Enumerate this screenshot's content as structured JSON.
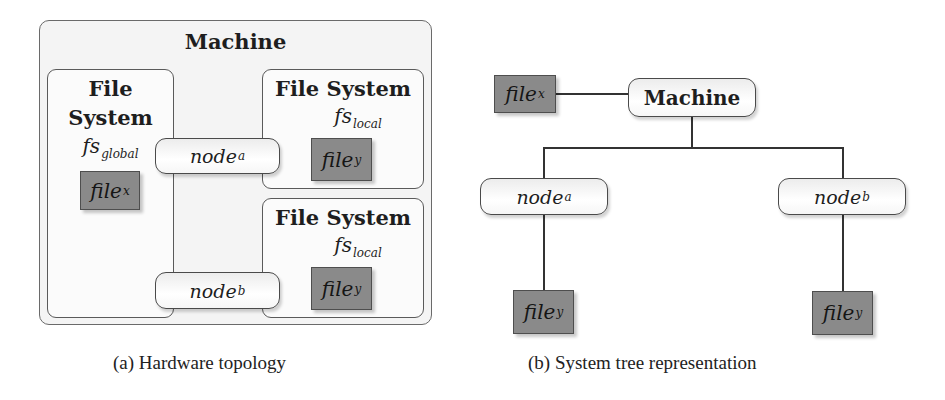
{
  "figure_a": {
    "caption": "(a) Hardware topology",
    "machine_title": "Machine",
    "global_fs": {
      "title_line1": "File",
      "title_line2": "System",
      "label_base": "fs",
      "label_sub": "global",
      "file": {
        "base": "file",
        "sub": "x"
      }
    },
    "local_fs_top": {
      "title": "File System",
      "label_base": "fs",
      "label_sub": "local",
      "file": {
        "base": "file",
        "sub": "y"
      }
    },
    "local_fs_bottom": {
      "title": "File System",
      "label_base": "fs",
      "label_sub": "local",
      "file": {
        "base": "file",
        "sub": "y"
      }
    },
    "node_a": {
      "base": "node",
      "sub": "a"
    },
    "node_b": {
      "base": "node",
      "sub": "b"
    }
  },
  "figure_b": {
    "caption": "(b) System tree representation",
    "root": "Machine",
    "root_file": {
      "base": "file",
      "sub": "x"
    },
    "node_a": {
      "base": "node",
      "sub": "a",
      "file": {
        "base": "file",
        "sub": "y"
      }
    },
    "node_b": {
      "base": "node",
      "sub": "b",
      "file": {
        "base": "file",
        "sub": "y"
      }
    }
  },
  "colors": {
    "file_fill": "#8a8a8a",
    "box_border": "#5a5a5a",
    "line": "#333333"
  }
}
